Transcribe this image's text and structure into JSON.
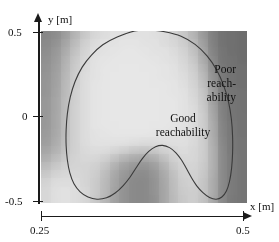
{
  "figure": {
    "background_color": "#ffffff",
    "plot_background": "#b8b8b8"
  },
  "axes": {
    "x": {
      "title": "x [m]",
      "ticks": [
        {
          "label": "0.25",
          "value": 0.25
        },
        {
          "label": "0.5",
          "value": 0.5
        }
      ],
      "range": [
        0.25,
        0.5
      ]
    },
    "y": {
      "title": "y [m]",
      "ticks": [
        {
          "label": "0.5",
          "value": 0.5
        },
        {
          "label": "0",
          "value": 0
        },
        {
          "label": "-0.5",
          "value": -0.5
        }
      ],
      "range": [
        -0.5,
        0.5
      ]
    }
  },
  "annotations": {
    "good": {
      "line1": "Good",
      "line2": "reachability"
    },
    "poor": {
      "line1": "Poor",
      "line2": "reach-",
      "line3": "ability"
    }
  },
  "chart_data": {
    "type": "heatmap",
    "title": "",
    "xlabel": "x [m]",
    "ylabel": "y [m]",
    "xlim": [
      0.25,
      0.5
    ],
    "ylim": [
      -0.5,
      0.5
    ],
    "grid": false,
    "legend": null,
    "colormap": "grayscale",
    "colormap_note": "light gray = good reachability (high value), dark gray = poor reachability (low value)",
    "value_range": [
      0,
      1
    ],
    "x": [
      0.25,
      0.2625,
      0.275,
      0.2875,
      0.3,
      0.3125,
      0.325,
      0.3375,
      0.35,
      0.3625,
      0.375,
      0.3875,
      0.4,
      0.4125,
      0.425,
      0.4375,
      0.45,
      0.4625,
      0.475,
      0.4875,
      0.5
    ],
    "y": [
      0.5,
      0.45,
      0.4,
      0.35,
      0.3,
      0.25,
      0.2,
      0.15,
      0.1,
      0.05,
      0.0,
      -0.05,
      -0.1,
      -0.15,
      -0.2,
      -0.25,
      -0.3,
      -0.35,
      -0.4,
      -0.45,
      -0.5
    ],
    "z": [
      [
        0.38,
        0.42,
        0.52,
        0.66,
        0.78,
        0.86,
        0.9,
        0.92,
        0.92,
        0.92,
        0.92,
        0.91,
        0.89,
        0.85,
        0.78,
        0.66,
        0.5,
        0.34,
        0.26,
        0.24,
        0.23
      ],
      [
        0.4,
        0.45,
        0.56,
        0.7,
        0.82,
        0.89,
        0.92,
        0.93,
        0.94,
        0.94,
        0.93,
        0.92,
        0.9,
        0.87,
        0.81,
        0.7,
        0.53,
        0.35,
        0.26,
        0.24,
        0.23
      ],
      [
        0.42,
        0.48,
        0.6,
        0.74,
        0.85,
        0.91,
        0.93,
        0.94,
        0.95,
        0.95,
        0.94,
        0.93,
        0.92,
        0.89,
        0.84,
        0.74,
        0.57,
        0.37,
        0.27,
        0.24,
        0.23
      ],
      [
        0.44,
        0.5,
        0.63,
        0.77,
        0.87,
        0.92,
        0.94,
        0.95,
        0.95,
        0.95,
        0.95,
        0.94,
        0.93,
        0.91,
        0.86,
        0.78,
        0.61,
        0.39,
        0.28,
        0.25,
        0.23
      ],
      [
        0.45,
        0.52,
        0.65,
        0.79,
        0.88,
        0.93,
        0.95,
        0.95,
        0.96,
        0.96,
        0.95,
        0.95,
        0.94,
        0.92,
        0.88,
        0.81,
        0.65,
        0.42,
        0.29,
        0.25,
        0.24
      ],
      [
        0.46,
        0.53,
        0.67,
        0.8,
        0.89,
        0.93,
        0.95,
        0.96,
        0.96,
        0.96,
        0.96,
        0.95,
        0.94,
        0.93,
        0.9,
        0.83,
        0.69,
        0.45,
        0.3,
        0.26,
        0.24
      ],
      [
        0.47,
        0.54,
        0.68,
        0.81,
        0.9,
        0.94,
        0.95,
        0.96,
        0.96,
        0.96,
        0.96,
        0.95,
        0.95,
        0.94,
        0.91,
        0.85,
        0.72,
        0.48,
        0.31,
        0.26,
        0.24
      ],
      [
        0.47,
        0.55,
        0.69,
        0.82,
        0.9,
        0.94,
        0.95,
        0.96,
        0.96,
        0.96,
        0.96,
        0.96,
        0.95,
        0.94,
        0.92,
        0.87,
        0.75,
        0.51,
        0.32,
        0.27,
        0.25
      ],
      [
        0.48,
        0.56,
        0.7,
        0.82,
        0.9,
        0.94,
        0.95,
        0.96,
        0.96,
        0.96,
        0.96,
        0.96,
        0.95,
        0.95,
        0.93,
        0.88,
        0.77,
        0.54,
        0.33,
        0.27,
        0.25
      ],
      [
        0.48,
        0.56,
        0.7,
        0.83,
        0.9,
        0.94,
        0.95,
        0.96,
        0.96,
        0.96,
        0.96,
        0.96,
        0.95,
        0.95,
        0.93,
        0.89,
        0.79,
        0.56,
        0.34,
        0.28,
        0.25
      ],
      [
        0.48,
        0.57,
        0.71,
        0.83,
        0.9,
        0.94,
        0.95,
        0.96,
        0.96,
        0.96,
        0.96,
        0.96,
        0.95,
        0.95,
        0.93,
        0.89,
        0.8,
        0.58,
        0.35,
        0.28,
        0.26
      ],
      [
        0.49,
        0.57,
        0.71,
        0.83,
        0.9,
        0.94,
        0.95,
        0.95,
        0.96,
        0.96,
        0.96,
        0.95,
        0.95,
        0.94,
        0.93,
        0.89,
        0.81,
        0.6,
        0.36,
        0.29,
        0.26
      ],
      [
        0.5,
        0.58,
        0.71,
        0.83,
        0.9,
        0.93,
        0.94,
        0.95,
        0.95,
        0.95,
        0.95,
        0.94,
        0.94,
        0.93,
        0.92,
        0.89,
        0.81,
        0.61,
        0.37,
        0.29,
        0.26
      ],
      [
        0.52,
        0.6,
        0.72,
        0.83,
        0.89,
        0.92,
        0.93,
        0.93,
        0.92,
        0.91,
        0.9,
        0.9,
        0.91,
        0.91,
        0.91,
        0.88,
        0.81,
        0.62,
        0.38,
        0.3,
        0.27
      ],
      [
        0.56,
        0.64,
        0.74,
        0.83,
        0.88,
        0.9,
        0.89,
        0.86,
        0.82,
        0.78,
        0.76,
        0.78,
        0.83,
        0.87,
        0.89,
        0.87,
        0.81,
        0.63,
        0.39,
        0.3,
        0.27
      ],
      [
        0.62,
        0.7,
        0.78,
        0.84,
        0.87,
        0.86,
        0.82,
        0.74,
        0.66,
        0.6,
        0.58,
        0.62,
        0.72,
        0.82,
        0.87,
        0.86,
        0.8,
        0.63,
        0.4,
        0.31,
        0.28
      ],
      [
        0.7,
        0.77,
        0.82,
        0.85,
        0.85,
        0.82,
        0.75,
        0.64,
        0.54,
        0.48,
        0.46,
        0.52,
        0.64,
        0.77,
        0.84,
        0.85,
        0.79,
        0.63,
        0.4,
        0.31,
        0.28
      ],
      [
        0.78,
        0.84,
        0.87,
        0.87,
        0.85,
        0.8,
        0.71,
        0.58,
        0.48,
        0.42,
        0.41,
        0.47,
        0.59,
        0.73,
        0.82,
        0.83,
        0.78,
        0.62,
        0.4,
        0.31,
        0.28
      ],
      [
        0.84,
        0.89,
        0.9,
        0.89,
        0.85,
        0.79,
        0.69,
        0.56,
        0.46,
        0.4,
        0.39,
        0.45,
        0.57,
        0.71,
        0.8,
        0.82,
        0.76,
        0.61,
        0.4,
        0.31,
        0.28
      ],
      [
        0.86,
        0.91,
        0.92,
        0.9,
        0.86,
        0.79,
        0.68,
        0.55,
        0.45,
        0.4,
        0.39,
        0.45,
        0.56,
        0.7,
        0.79,
        0.81,
        0.75,
        0.6,
        0.39,
        0.31,
        0.28
      ],
      [
        0.86,
        0.91,
        0.92,
        0.9,
        0.86,
        0.78,
        0.67,
        0.54,
        0.45,
        0.4,
        0.39,
        0.44,
        0.56,
        0.69,
        0.78,
        0.8,
        0.74,
        0.59,
        0.39,
        0.3,
        0.28
      ]
    ],
    "contours": [
      {
        "name": "reachability-boundary",
        "level": 0.9,
        "closed": true,
        "color": "#3a3a3a",
        "points_normalized": [
          [
            0.455,
            1.0
          ],
          [
            0.37,
            0.965
          ],
          [
            0.3,
            0.92
          ],
          [
            0.245,
            0.86
          ],
          [
            0.2,
            0.79
          ],
          [
            0.165,
            0.705
          ],
          [
            0.142,
            0.615
          ],
          [
            0.128,
            0.52
          ],
          [
            0.122,
            0.425
          ],
          [
            0.122,
            0.335
          ],
          [
            0.128,
            0.25
          ],
          [
            0.14,
            0.175
          ],
          [
            0.16,
            0.112
          ],
          [
            0.19,
            0.065
          ],
          [
            0.228,
            0.035
          ],
          [
            0.272,
            0.022
          ],
          [
            0.318,
            0.03
          ],
          [
            0.36,
            0.058
          ],
          [
            0.398,
            0.1
          ],
          [
            0.432,
            0.15
          ],
          [
            0.462,
            0.205
          ],
          [
            0.492,
            0.258
          ],
          [
            0.523,
            0.3
          ],
          [
            0.556,
            0.327
          ],
          [
            0.59,
            0.335
          ],
          [
            0.624,
            0.322
          ],
          [
            0.655,
            0.292
          ],
          [
            0.682,
            0.25
          ],
          [
            0.706,
            0.2
          ],
          [
            0.73,
            0.148
          ],
          [
            0.756,
            0.1
          ],
          [
            0.786,
            0.06
          ],
          [
            0.818,
            0.032
          ],
          [
            0.85,
            0.022
          ],
          [
            0.878,
            0.035
          ],
          [
            0.9,
            0.07
          ],
          [
            0.915,
            0.125
          ],
          [
            0.925,
            0.2
          ],
          [
            0.93,
            0.29
          ],
          [
            0.93,
            0.39
          ],
          [
            0.924,
            0.49
          ],
          [
            0.91,
            0.59
          ],
          [
            0.886,
            0.685
          ],
          [
            0.852,
            0.775
          ],
          [
            0.806,
            0.855
          ],
          [
            0.748,
            0.922
          ],
          [
            0.68,
            0.97
          ],
          [
            0.6,
            0.996
          ],
          [
            0.53,
            1.005
          ]
        ]
      }
    ],
    "annotations": [
      {
        "text": "Good reachability",
        "x_normalized": 0.43,
        "y_normalized": 0.6,
        "region": "inside-contour"
      },
      {
        "text": "Poor reachability",
        "x_normalized": 0.9,
        "y_normalized": 0.9,
        "region": "outside-contour"
      }
    ]
  }
}
